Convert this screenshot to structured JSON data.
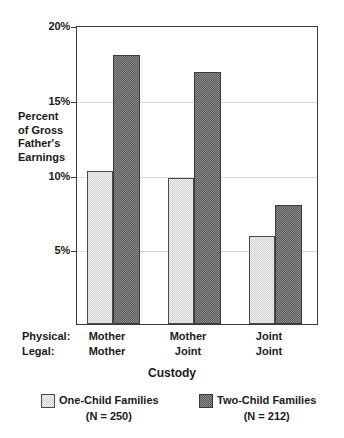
{
  "chart_data": {
    "type": "bar",
    "title": "",
    "xlabel": "Custody",
    "ylabel": "Percent of Gross Father's Earnings",
    "ylabel_lines": [
      "Percent",
      "of Gross",
      "Father's",
      "Earnings"
    ],
    "ylim": [
      0,
      20
    ],
    "yticks": [
      5,
      10,
      15,
      20
    ],
    "ytick_labels": [
      "5%",
      "10%",
      "15%",
      "20%"
    ],
    "grid": true,
    "legend_position": "bottom",
    "category_key_rows": [
      {
        "key": "Physical:",
        "values": [
          "Mother",
          "Mother",
          "Joint"
        ]
      },
      {
        "key": "Legal:",
        "values": [
          "Mother",
          "Joint",
          "Joint"
        ]
      }
    ],
    "categories": [
      "Mother / Mother",
      "Mother / Joint",
      "Joint / Joint"
    ],
    "series": [
      {
        "name": "One-Child Families",
        "sub": "(N = 250)",
        "color": "#ededed",
        "values": [
          10.3,
          9.8,
          5.9
        ]
      },
      {
        "name": "Two-Child Families",
        "sub": "(N = 212)",
        "color": "#8a8a8a",
        "values": [
          18.1,
          17.0,
          8.0
        ]
      }
    ]
  }
}
